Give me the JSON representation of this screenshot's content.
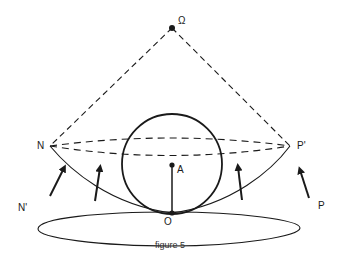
{
  "figure": {
    "caption": "figure 5",
    "labels": {
      "omega": "Ω",
      "n": "N",
      "p_prime": "P'",
      "a": "A",
      "n_prime": "N'",
      "o": "O",
      "p": "P"
    },
    "colors": {
      "stroke": "#1a1a1a",
      "background": "#ffffff"
    }
  }
}
